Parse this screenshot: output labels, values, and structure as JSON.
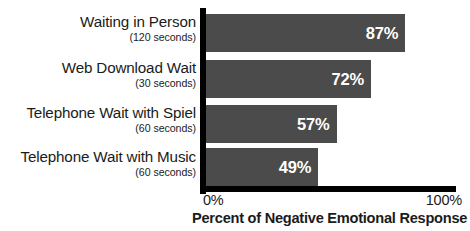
{
  "chart_data": {
    "type": "bar",
    "orientation": "horizontal",
    "title": "",
    "xlabel": "Percent of Negative Emotional Response",
    "ylabel": "",
    "xlim": [
      0,
      100
    ],
    "grid": false,
    "legend": null,
    "x_tick_labels": [
      "0%",
      "100%"
    ],
    "categories": [
      "Waiting in Person",
      "Web Download Wait",
      "Telephone Wait with Spiel",
      "Telephone Wait with Music"
    ],
    "category_subtitles": [
      "(120 seconds)",
      "(30 seconds)",
      "(60 seconds)",
      "(60 seconds)"
    ],
    "values": [
      87,
      72,
      57,
      49
    ],
    "value_labels": [
      "87%",
      "72%",
      "57%",
      "49%"
    ],
    "bars": [
      {
        "category": "Waiting in Person",
        "subtitle": "(120 seconds)",
        "value": 87,
        "label": "87%"
      },
      {
        "category": "Web Download Wait",
        "subtitle": "(30 seconds)",
        "value": 72,
        "label": "72%"
      },
      {
        "category": "Telephone Wait with Spiel",
        "subtitle": "(60 seconds)",
        "value": 57,
        "label": "57%"
      },
      {
        "category": "Telephone Wait with Music",
        "subtitle": "(60 seconds)",
        "value": 49,
        "label": "49%"
      }
    ],
    "colors": {
      "bar_fill": "#4b4b4b",
      "value_text": "#ffffff",
      "axis": "#000000",
      "label_text": "#1b1b1b",
      "background": "#ffffff"
    }
  }
}
